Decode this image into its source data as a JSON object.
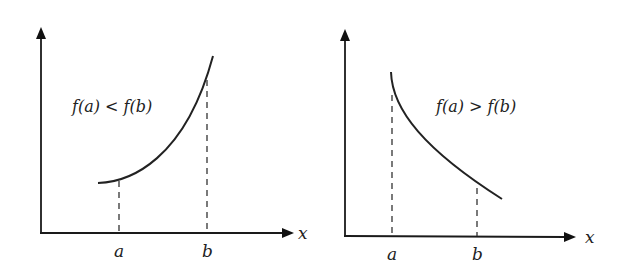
{
  "panels": [
    {
      "id": "increasing",
      "relation_label": "f(a) < f(b)",
      "x_axis_label": "x",
      "tick_a": "a",
      "tick_b": "b",
      "description": "increasing function, curve rising from a to b"
    },
    {
      "id": "decreasing",
      "relation_label": "f(a) > f(b)",
      "x_axis_label": "x",
      "tick_a": "a",
      "tick_b": "b",
      "description": "decreasing function, curve falling from a to b"
    }
  ],
  "colors": {
    "background": "#ffffff",
    "ink": "#222222"
  }
}
